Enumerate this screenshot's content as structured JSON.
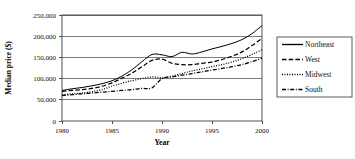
{
  "chart_data": {
    "type": "line",
    "title": "",
    "xlabel": "Year",
    "ylabel": "Median price ($)",
    "xlim": [
      1980,
      2000
    ],
    "ylim": [
      0,
      250000
    ],
    "grid": true,
    "legend_position": "right",
    "x": [
      1980,
      1981,
      1982,
      1983,
      1984,
      1985,
      1986,
      1987,
      1988,
      1989,
      1990,
      1991,
      1992,
      1993,
      1994,
      1995,
      1996,
      1997,
      1998,
      1999,
      2000
    ],
    "xticks": [
      "1980",
      "1985",
      "1990",
      "1995",
      "2000"
    ],
    "xtick_values": [
      1980,
      1985,
      1990,
      1995,
      2000
    ],
    "yticks": [
      "0",
      "50,000",
      "100,000",
      "150,000",
      "200,000",
      "250,000"
    ],
    "ytick_values": [
      0,
      50000,
      100000,
      150000,
      200000,
      250000
    ],
    "series": [
      {
        "name": "Northeast",
        "style": "solid",
        "values": [
          72000,
          76000,
          79000,
          83000,
          88000,
          95000,
          106000,
          121000,
          140000,
          157000,
          156000,
          152000,
          162000,
          158000,
          163000,
          170000,
          176000,
          183000,
          192000,
          206000,
          225000
        ]
      },
      {
        "name": "West",
        "style": "dashed",
        "values": [
          70000,
          72000,
          74000,
          77000,
          82000,
          90000,
          101000,
          113000,
          128000,
          143000,
          146000,
          136000,
          133000,
          133000,
          136000,
          139000,
          145000,
          153000,
          163000,
          178000,
          195000
        ]
      },
      {
        "name": "Midwest",
        "style": "dotted",
        "values": [
          62000,
          64000,
          66000,
          69000,
          74000,
          82000,
          89000,
          95000,
          100000,
          104000,
          102000,
          106000,
          112000,
          118000,
          123000,
          128000,
          133000,
          139000,
          147000,
          157000,
          168000
        ]
      },
      {
        "name": "South",
        "style": "dashdot",
        "values": [
          60000,
          62000,
          64000,
          66000,
          68000,
          70000,
          72000,
          74000,
          77000,
          78000,
          100000,
          104000,
          108000,
          112000,
          116000,
          120000,
          124000,
          128000,
          133000,
          140000,
          148000
        ]
      }
    ]
  },
  "legend": {
    "items": [
      {
        "label": "Northeast",
        "style": "solid"
      },
      {
        "label": "West",
        "style": "dashed"
      },
      {
        "label": "Midwest",
        "style": "dotted"
      },
      {
        "label": "South",
        "style": "dashdot"
      }
    ]
  }
}
